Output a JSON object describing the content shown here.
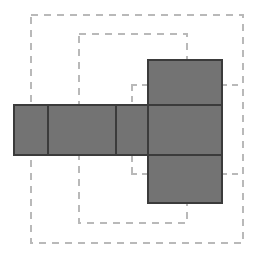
{
  "canvas": {
    "width": 258,
    "height": 261,
    "background": "#ffffff"
  },
  "colors": {
    "square_fill": "#737373",
    "square_stroke": "#3b3b3b",
    "dashed_stroke": "#b9b9b9",
    "background": "#ffffff"
  },
  "geometry": {
    "square_stroke_width": 1.2,
    "dashed_stroke_width": 1.2,
    "dash_pattern": "7 6",
    "dash_pattern_short": "6 5"
  },
  "squares": [
    {
      "name": "square-row-1",
      "x": 14,
      "y": 105,
      "w": 34,
      "h": 50
    },
    {
      "name": "square-row-2",
      "x": 48,
      "y": 105,
      "w": 68,
      "h": 50
    },
    {
      "name": "square-row-3",
      "x": 116,
      "y": 105,
      "w": 32,
      "h": 50
    },
    {
      "name": "square-row-4",
      "x": 148,
      "y": 105,
      "w": 74,
      "h": 50
    },
    {
      "name": "square-top",
      "x": 148,
      "y": 60,
      "w": 74,
      "h": 45
    },
    {
      "name": "square-bottom",
      "x": 148,
      "y": 155,
      "w": 74,
      "h": 48
    }
  ],
  "dashed_rects": [
    {
      "name": "outer-guide-rect",
      "x": 31,
      "y": 15,
      "w": 212,
      "h": 228
    },
    {
      "name": "inner-guide-rect",
      "x": 79,
      "y": 34,
      "w": 108,
      "h": 189
    }
  ],
  "dashed_segments": [
    {
      "name": "fold-guide-upper-horizontal",
      "x1": 131,
      "y1": 85,
      "x2": 150,
      "y2": 85
    },
    {
      "name": "fold-guide-upper-vertical",
      "x1": 132,
      "y1": 85,
      "x2": 132,
      "y2": 104
    },
    {
      "name": "fold-guide-upper-right",
      "x1": 221,
      "y1": 85,
      "x2": 243,
      "y2": 85
    },
    {
      "name": "fold-guide-lower-horizontal",
      "x1": 131,
      "y1": 174,
      "x2": 150,
      "y2": 174
    },
    {
      "name": "fold-guide-lower-vertical",
      "x1": 132,
      "y1": 156,
      "x2": 132,
      "y2": 175
    },
    {
      "name": "fold-guide-lower-right",
      "x1": 221,
      "y1": 174,
      "x2": 243,
      "y2": 174
    }
  ]
}
